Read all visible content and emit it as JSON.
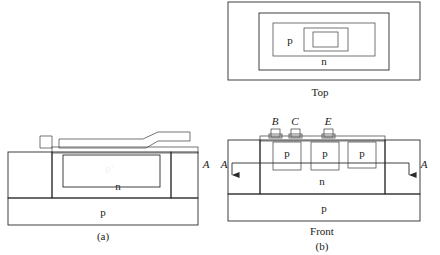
{
  "figure": {
    "panels": [
      {
        "id": "a",
        "caption": "(a)"
      },
      {
        "id": "b",
        "caption": "(b)"
      }
    ]
  },
  "panel_a": {
    "caption": "(a)",
    "region_labels": {
      "pplus": "p+",
      "pplus_base": "p",
      "pplus_sup": "+",
      "n_epi": "n",
      "p_substrate": "p"
    },
    "section_label": "A"
  },
  "panel_b": {
    "caption": "(b)",
    "views": {
      "top_label": "Top",
      "front_label": "Front"
    },
    "top_view": {
      "p_label": "p",
      "n_label": "n"
    },
    "front_view": {
      "terminals": [
        {
          "name": "B",
          "label": "B"
        },
        {
          "name": "C",
          "label": "C"
        },
        {
          "name": "E",
          "label": "E"
        }
      ],
      "wells": [
        {
          "label": "p"
        },
        {
          "label": "p"
        },
        {
          "label": "p"
        }
      ],
      "n_label": "n",
      "p_substrate_label": "p",
      "section_left_label": "A",
      "section_right_label": "A"
    }
  },
  "colors": {
    "background": "#ffffff",
    "hatch_line": "#6f6f6f",
    "oxide_fill": "#f2f2f2",
    "n_region": "#a9a9a9",
    "p_well": "#c4c4c4",
    "p_substrate": "#d8d8d8",
    "p_plus_dark": "#4a4a4a",
    "metal": "#5a5a5a",
    "outline": "#2b2b2b"
  }
}
